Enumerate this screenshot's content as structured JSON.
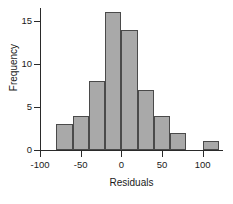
{
  "chart_data": {
    "type": "bar",
    "title": "",
    "subtitle": "",
    "xlabel": "Residuals",
    "ylabel": "Frequency",
    "xlim": [
      -100,
      125
    ],
    "ylim": [
      0,
      16.5
    ],
    "grid": false,
    "legend": null,
    "bin_width": 20,
    "categories": [
      "-80 to -60",
      "-60 to -40",
      "-40 to -20",
      "-20 to 0",
      "0 to 20",
      "20 to 40",
      "40 to 60",
      "60 to 80",
      "80 to 100",
      "100 to 120"
    ],
    "bin_edges": [
      -80,
      -60,
      -40,
      -20,
      0,
      20,
      40,
      60,
      80,
      100,
      120
    ],
    "values": [
      3,
      4,
      8,
      16,
      14,
      7,
      4,
      2,
      0,
      1
    ],
    "x_ticks": [
      -100,
      -50,
      0,
      50,
      100
    ],
    "x_tick_labels": [
      "-100",
      "-50",
      "0",
      "50",
      "100"
    ],
    "y_ticks": [
      0,
      5,
      10,
      15
    ],
    "y_tick_labels": [
      "0",
      "5",
      "10",
      "15"
    ],
    "bar_fill_color": "#a9a9a9",
    "bar_edge_color": "#4a4a4a",
    "axis_color": "#2a2a2a",
    "background_color": "#ffffff"
  }
}
